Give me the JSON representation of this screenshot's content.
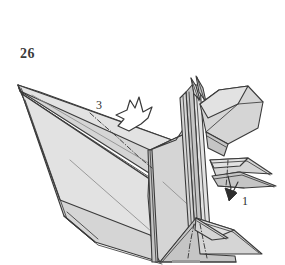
{
  "figure": {
    "kind": "origami-instruction-diagram",
    "step_number": "26",
    "background_color": "#ffffff",
    "paper_fill": "#d5d5d5",
    "paper_fill_light": "#e2e2e2",
    "paper_fill_shadow": "#c2c2c2",
    "outline_color": "#3a3a3a",
    "crease_color": "#8a8a8a",
    "label_color": "#2e2e2e",
    "step_number_color": "#3b3b3b"
  },
  "annotations": {
    "fold_labels": [
      {
        "id": "label-3",
        "text": "3",
        "position": "upper-middle, left of the hollow arrow",
        "arrow_type": "hollow-push-fold-arrow",
        "arrow_direction": "down-left"
      },
      {
        "id": "label-1",
        "text": "1",
        "position": "right side, below the near wing flap",
        "arrow_type": "solid-valley-fold-arrow",
        "arrow_direction": "down-left"
      }
    ],
    "crease_lines": [
      {
        "name": "wing-dash-dot-crease",
        "style": "dash-dot",
        "meaning": "mountain-fold",
        "location": "across the large left wing"
      },
      {
        "name": "right-flap-dash-dot-crease",
        "style": "dash-dot",
        "meaning": "mountain-fold",
        "location": "on the right side flap near label 1"
      },
      {
        "name": "tail-dash-dot-crease-left",
        "style": "dash-dot",
        "meaning": "mountain-fold",
        "location": "lower tail, left crease"
      },
      {
        "name": "tail-dash-dot-crease-right",
        "style": "dash-dot",
        "meaning": "mountain-fold",
        "location": "lower tail, right crease"
      }
    ],
    "page_artifact": {
      "name": "bottom-rule",
      "description": "short horizontal gray bar at the bottom edge",
      "color": "#9a9a9a"
    }
  }
}
